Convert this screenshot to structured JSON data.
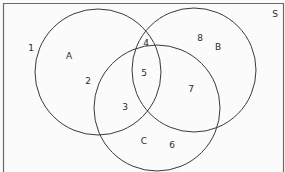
{
  "diagram": {
    "type": "venn",
    "universal_set_label": "S",
    "sets": [
      {
        "name": "A",
        "cx": 98,
        "cy": 72,
        "r": 63
      },
      {
        "name": "B",
        "cx": 194,
        "cy": 70,
        "r": 62
      },
      {
        "name": "C",
        "cx": 157,
        "cy": 108,
        "r": 63
      }
    ],
    "colors": {
      "stroke": "#3a3a3a",
      "border": "#6a6a6a",
      "background": "#fbfbfb",
      "text": "#2a2a2a"
    },
    "labels": {
      "S": "S",
      "A": "A",
      "B": "B",
      "C": "C",
      "r1": "1",
      "r2": "2",
      "r3": "3",
      "r4": "4",
      "r5": "5",
      "r6": "6",
      "r7": "7",
      "r8": "8"
    },
    "regions": [
      {
        "label": "1",
        "location": "S only (outside A, B, C)"
      },
      {
        "label": "2",
        "location": "A only"
      },
      {
        "label": "3",
        "location": "A ∩ C only"
      },
      {
        "label": "4",
        "location": "A ∩ B only"
      },
      {
        "label": "5",
        "location": "A ∩ B ∩ C"
      },
      {
        "label": "6",
        "location": "C only"
      },
      {
        "label": "7",
        "location": "B ∩ C only"
      },
      {
        "label": "8",
        "location": "B only"
      }
    ]
  }
}
